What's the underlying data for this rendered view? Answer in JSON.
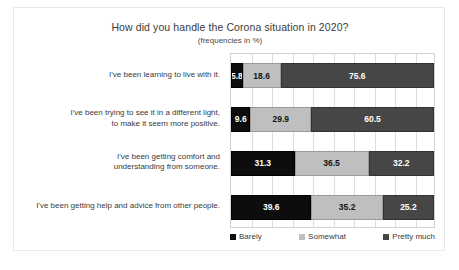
{
  "chart_data": {
    "type": "bar",
    "orientation": "horizontal",
    "stacked": "100%",
    "title": "How did you handle the Corona situation in 2020?",
    "subtitle": "(frequencies in %)",
    "xlabel": "",
    "ylabel": "",
    "xlim": [
      0,
      100
    ],
    "grid": true,
    "gridline_interval": 10,
    "legend_position": "bottom",
    "categories": [
      "I've been learning to live with it.",
      "I've been trying to see it in a different light, to make it seem more positive.",
      "I've been getting comfort and understanding from someone.",
      "I've been getting help and advice from other people."
    ],
    "category_lines": [
      [
        "I've been learning to live with it."
      ],
      [
        "I've been trying to see it in a different light,",
        "to make it seem more positive."
      ],
      [
        "I've been getting comfort and",
        "understanding from someone."
      ],
      [
        "I've been getting help and advice from other people."
      ]
    ],
    "series": [
      {
        "name": "Barely",
        "color": "#0d0d0d",
        "values": [
          5.8,
          9.6,
          31.3,
          39.6
        ],
        "labels": [
          "5.8",
          "9.6",
          "31.3",
          "39.6"
        ]
      },
      {
        "name": "Somewhat",
        "color": "#bfbfbf",
        "values": [
          18.6,
          29.9,
          36.5,
          35.2
        ],
        "labels": [
          "18.6",
          "29.9",
          "36.5",
          "35.2"
        ]
      },
      {
        "name": "Pretty much",
        "color": "#464646",
        "values": [
          75.6,
          60.5,
          32.2,
          25.2
        ],
        "labels": [
          "75.6",
          "60.5",
          "32.2",
          "25.2"
        ]
      }
    ]
  },
  "legend": {
    "items": [
      {
        "label": "Barely",
        "color": "#0d0d0d"
      },
      {
        "label": "Somewhat",
        "color": "#bfbfbf"
      },
      {
        "label": "Pretty much",
        "color": "#464646"
      }
    ]
  }
}
